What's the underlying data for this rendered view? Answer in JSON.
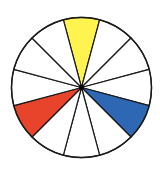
{
  "diagram": {
    "type": "color-wheel",
    "segment_count": 12,
    "center": {
      "x": 81.5,
      "y": 87.5
    },
    "radius": 70,
    "stroke_color": "#1a1a1a",
    "default_fill": "#ffffff",
    "hub_color": "#000000",
    "highlighted_segments": [
      {
        "name": "yellow",
        "clock_position": 12,
        "color": "#FFF44F"
      },
      {
        "name": "blue",
        "clock_position": 4,
        "color": "#2E68B4"
      },
      {
        "name": "red",
        "clock_position": 8,
        "color": "#E8432B"
      }
    ]
  }
}
